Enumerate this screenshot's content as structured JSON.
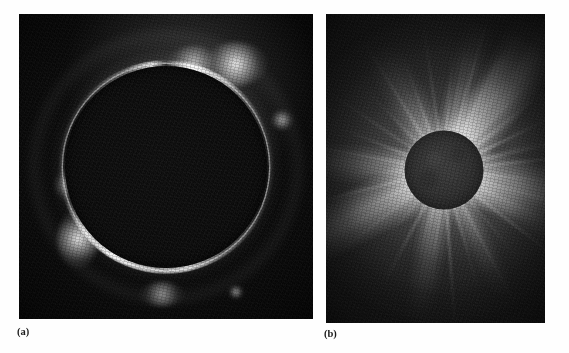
{
  "figure": {
    "kind": "two-panel photographic plate",
    "background_color": "#fefefe",
    "panels": [
      {
        "id": "a",
        "caption": "(a)",
        "subject": "Solar eclipse — diamond ring / chromosphere at the lunar limb",
        "frame_color": "#080808",
        "bounds": {
          "x": 19,
          "y": 14,
          "width": 294,
          "height": 305
        },
        "disk": {
          "center_x": 166,
          "center_y": 152,
          "radius": 101
        },
        "highlights": [
          {
            "name": "upper-right-bead",
            "angle_deg": 62,
            "intensity": 1.0
          },
          {
            "name": "upper-left-arc",
            "angle_deg": 100,
            "intensity": 0.7
          },
          {
            "name": "left-arc",
            "angle_deg": 205,
            "intensity": 0.95
          },
          {
            "name": "lower-arc",
            "angle_deg": 262,
            "intensity": 0.6
          },
          {
            "name": "right-prominence",
            "angle_deg": 18,
            "intensity": 0.72
          },
          {
            "name": "lower-right-bead",
            "angle_deg": 295,
            "intensity": 0.85
          }
        ]
      },
      {
        "id": "b",
        "caption": "(b)",
        "subject": "Total solar eclipse — extended white-light corona with streamers",
        "frame_color": "#101010",
        "bounds": {
          "x": 326,
          "y": 14,
          "width": 219,
          "height": 309
        },
        "disk": {
          "center_x": 118,
          "center_y": 156,
          "radius": 40
        },
        "streamers": [
          {
            "name": "north-east-streamer",
            "angle_deg": -52,
            "length": 165,
            "width": 56,
            "opacity": 0.95
          },
          {
            "name": "north-streamer",
            "angle_deg": -76,
            "length": 120,
            "width": 40,
            "opacity": 0.72
          },
          {
            "name": "north-north-east",
            "angle_deg": -62,
            "length": 140,
            "width": 30,
            "opacity": 0.8
          },
          {
            "name": "north-west-fan",
            "angle_deg": -118,
            "length": 110,
            "width": 46,
            "opacity": 0.6
          },
          {
            "name": "east-broad-streamer",
            "angle_deg": 14,
            "length": 150,
            "width": 62,
            "opacity": 0.85
          },
          {
            "name": "east-lower-streamer",
            "angle_deg": 30,
            "length": 120,
            "width": 34,
            "opacity": 0.55
          },
          {
            "name": "south-west-streamer",
            "angle_deg": 152,
            "length": 165,
            "width": 58,
            "opacity": 0.95
          },
          {
            "name": "west-streamer",
            "angle_deg": 184,
            "length": 120,
            "width": 42,
            "opacity": 0.7
          },
          {
            "name": "south-streamer",
            "angle_deg": 100,
            "length": 125,
            "width": 36,
            "opacity": 0.62
          },
          {
            "name": "south-east-streamer",
            "angle_deg": 64,
            "length": 110,
            "width": 30,
            "opacity": 0.55
          }
        ],
        "ray_angles_deg": [
          -88,
          -80,
          -72,
          -64,
          -56,
          -46,
          -36,
          -26,
          -16,
          -6,
          6,
          16,
          26,
          38,
          50,
          62,
          74,
          86,
          96,
          106,
          118,
          130,
          142,
          154,
          166,
          178,
          190,
          202,
          214,
          226,
          238,
          250,
          262,
          274,
          286,
          298,
          310,
          322,
          334,
          346
        ]
      }
    ]
  }
}
